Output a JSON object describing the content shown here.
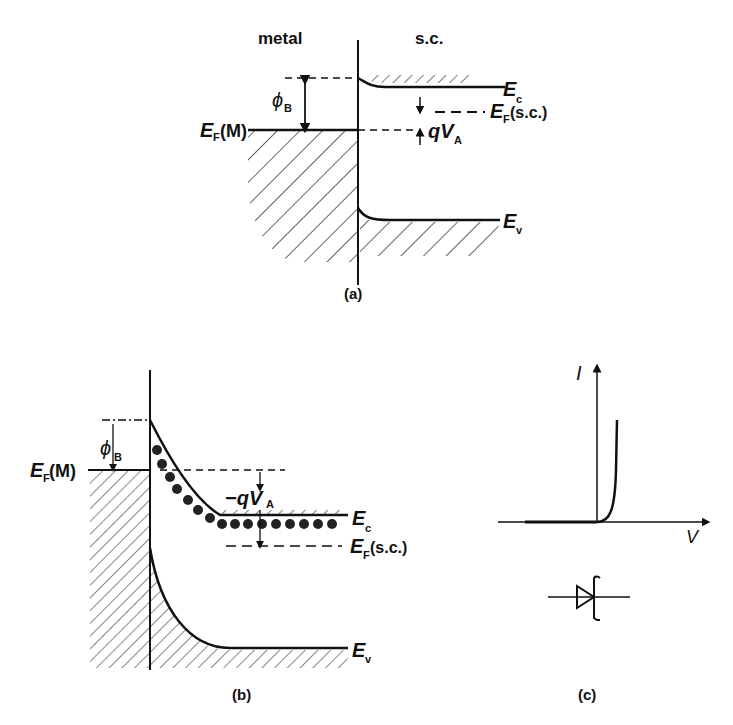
{
  "panel_a": {
    "caption": "(a)",
    "header_left": "metal",
    "header_right": "s.c.",
    "phi_b": "ϕ",
    "phi_b_sub": "B",
    "ef_m": "E",
    "ef_m_sub": "F",
    "ef_m_suffix": "(M)",
    "ec": "E",
    "ec_sub": "c",
    "ef_sc": "E",
    "ef_sc_sub": "F",
    "ef_sc_suffix": "(s.c.)",
    "qva": "qV",
    "qva_sub": "A",
    "ev": "E",
    "ev_sub": "v"
  },
  "panel_b": {
    "caption": "(b)",
    "phi_b": "ϕ",
    "phi_b_sub": "B",
    "ef_m": "E",
    "ef_m_sub": "F",
    "ef_m_suffix": " (M)",
    "qva": "−qV",
    "qva_sub": "A",
    "ec": "E",
    "ec_sub": "c",
    "ef_sc": "E",
    "ef_sc_sub": "F",
    "ef_sc_suffix": "(s.c.)",
    "ev": "E",
    "ev_sub": "v"
  },
  "panel_c": {
    "caption": "(c)",
    "y_axis": "I",
    "x_axis": "V"
  }
}
